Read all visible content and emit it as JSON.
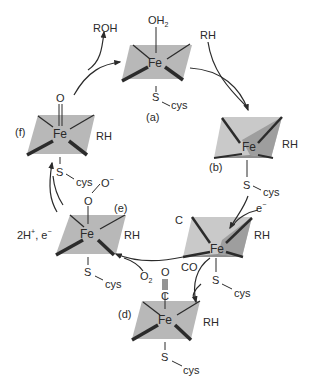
{
  "figure": {
    "colors": {
      "plane_fill": "#b8b8b8",
      "plane_dark": "#9a9a9a",
      "plane_light": "#cfcfcf",
      "line": "#2b2b2b",
      "background": "#ffffff"
    },
    "states": [
      {
        "id": "a",
        "label": "(a)",
        "metal": "Fe",
        "axial_top": "OH2",
        "axial_bottom": "S",
        "ligand": "cys",
        "substrate": ""
      },
      {
        "id": "b",
        "label": "(b)",
        "metal": "Fe",
        "axial_top": "",
        "axial_bottom": "S",
        "ligand": "cys",
        "substrate": "RH"
      },
      {
        "id": "c",
        "label": "(c)",
        "metal": "Fe",
        "axial_top": "",
        "axial_bottom": "S",
        "ligand": "cys",
        "substrate": "RH"
      },
      {
        "id": "d",
        "label": "(d)",
        "metal": "Fe",
        "axial_top": "C≡O",
        "axial_bottom": "S",
        "ligand": "cys",
        "substrate": "RH"
      },
      {
        "id": "e",
        "label": "(e)",
        "metal": "Fe",
        "axial_top": "O–O⁻",
        "axial_bottom": "S",
        "ligand": "cys",
        "substrate": "RH"
      },
      {
        "id": "f",
        "label": "(f)",
        "metal": "Fe",
        "axial_top": "O",
        "axial_bottom": "S",
        "ligand": "cys",
        "substrate": "RH"
      }
    ],
    "labels": {
      "a": "(a)",
      "b": "(b)",
      "c": "C",
      "d": "(d)",
      "e": "(e)",
      "f": "(f)",
      "fe": "Fe",
      "oh2_main": "OH",
      "oh2_sub": "2",
      "rh": "RH",
      "roh": "ROH",
      "s": "S",
      "cys": "cys",
      "e_minus_main": "e",
      "e_minus_sup": "−",
      "co": "CO",
      "o": "O",
      "o2_main": "O",
      "o2_sub": "2",
      "o_minus_main": "O",
      "o_minus_sup": "−",
      "two_h_main": "2H",
      "two_h_sup": "+",
      "two_h_rest": ", e",
      "two_h_sup2": "−"
    },
    "transitions": [
      {
        "from": "a",
        "to": "b",
        "input": "RH"
      },
      {
        "from": "b",
        "to": "c",
        "input": "e−"
      },
      {
        "from": "c",
        "to": "d",
        "input": "CO"
      },
      {
        "from": "c",
        "to": "e",
        "input": "O2"
      },
      {
        "from": "e",
        "to": "f",
        "input": "2H+, e−"
      },
      {
        "from": "f",
        "to": "a",
        "output": "ROH"
      }
    ]
  }
}
